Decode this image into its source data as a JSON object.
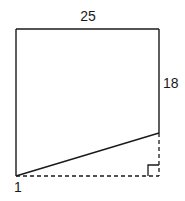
{
  "diagram": {
    "type": "geometry-figure",
    "labels": {
      "top": "25",
      "right": "18",
      "bottom_left": "1"
    },
    "colors": {
      "stroke": "#1a1a1a",
      "background": "#ffffff"
    },
    "points": {
      "top_left": [
        16,
        29
      ],
      "top_right": [
        159,
        29
      ],
      "right_solid_end": [
        159,
        133
      ],
      "bottom_left": [
        16,
        176
      ],
      "bottom_right_corner": [
        159,
        176
      ]
    },
    "right_angle_marker": {
      "size": 11
    }
  }
}
